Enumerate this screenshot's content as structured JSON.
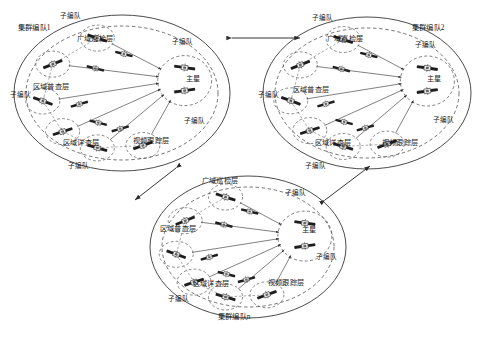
{
  "figure": {
    "type": "diagram",
    "cluster_count_shown": 3,
    "colors": {
      "line": "#2b2b2b",
      "dashed_boundary": "#3a3a3a",
      "satellite_body": "#f2f2f2",
      "satellite_panel": "#1e1e1e",
      "background": "#ffffff"
    }
  },
  "clusters": [
    {
      "id": "cluster1",
      "name": "集群编队1",
      "name_pos": {
        "x": 18,
        "y": 24
      },
      "center": {
        "x": 122,
        "y": 93
      },
      "rx": 108,
      "ry": 78,
      "main_node": {
        "label": "主星",
        "x": 186,
        "y": 76
      },
      "layers": [
        {
          "label": "广域巡检层",
          "x": 77,
          "y": 36
        },
        {
          "label": "区域普查层",
          "x": 33,
          "y": 84
        },
        {
          "label": "区域详查层",
          "x": 63,
          "y": 140
        },
        {
          "label": "视频跟踪层",
          "x": 133,
          "y": 138
        }
      ],
      "subteams": [
        {
          "label": "子编队",
          "x": 60,
          "y": 13
        },
        {
          "label": "子编队",
          "x": 172,
          "y": 39
        },
        {
          "label": "子编队",
          "x": 10,
          "y": 92
        },
        {
          "label": "子编队",
          "x": 184,
          "y": 118
        },
        {
          "label": "子编队",
          "x": 68,
          "y": 163
        }
      ]
    },
    {
      "id": "cluster2",
      "name": "集群编队2",
      "name_pos": {
        "x": 412,
        "y": 24
      },
      "center": {
        "x": 367,
        "y": 93
      },
      "rx": 104,
      "ry": 76,
      "main_node": {
        "label": "主星",
        "x": 427,
        "y": 76
      },
      "layers": [
        {
          "label": "广域巡检层",
          "x": 327,
          "y": 36
        },
        {
          "label": "区域普查层",
          "x": 293,
          "y": 87
        },
        {
          "label": "区域详查层",
          "x": 315,
          "y": 140
        },
        {
          "label": "视频跟踪层",
          "x": 382,
          "y": 140
        }
      ],
      "subteams": [
        {
          "label": "子编队",
          "x": 312,
          "y": 15
        },
        {
          "label": "子编队",
          "x": 415,
          "y": 42
        },
        {
          "label": "子编队",
          "x": 258,
          "y": 92
        },
        {
          "label": "子编队",
          "x": 433,
          "y": 117
        },
        {
          "label": "子编队",
          "x": 305,
          "y": 163
        }
      ]
    },
    {
      "id": "clusterN",
      "name": "集群编队n",
      "name_pos": {
        "x": 218,
        "y": 313
      },
      "center": {
        "x": 248,
        "y": 247
      },
      "rx": 98,
      "ry": 71,
      "main_node": {
        "label": "主星",
        "x": 302,
        "y": 227
      },
      "layers": [
        {
          "label": "广域巡检层",
          "x": 202,
          "y": 178
        },
        {
          "label": "区域普查层",
          "x": 160,
          "y": 226
        },
        {
          "label": "区域详查层",
          "x": 193,
          "y": 281
        },
        {
          "label": "视频跟踪层",
          "x": 268,
          "y": 280
        }
      ],
      "subteams": [
        {
          "label": "子编队",
          "x": 285,
          "y": 190
        },
        {
          "label": "子编队",
          "x": 316,
          "y": 254
        },
        {
          "label": "子编队",
          "x": 168,
          "y": 296
        }
      ]
    }
  ],
  "inter_cluster_links": [
    {
      "from": "cluster1",
      "to": "cluster2",
      "style": "double-arrow",
      "orientation": "horizontal"
    },
    {
      "from": "cluster1",
      "to": "clusterN",
      "style": "double-arrow",
      "orientation": "diagonal"
    },
    {
      "from": "cluster2",
      "to": "clusterN",
      "style": "double-arrow",
      "orientation": "diagonal"
    }
  ]
}
